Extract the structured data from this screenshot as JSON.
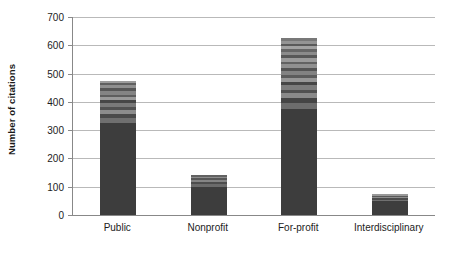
{
  "chart_data": {
    "type": "bar",
    "subtype": "stacked-bar",
    "title": "",
    "xlabel": "",
    "ylabel": "Number of citations",
    "ylim": [
      0,
      700
    ],
    "ytick_step": 100,
    "yticks": [
      0,
      100,
      200,
      300,
      400,
      500,
      600,
      700
    ],
    "ytick_labels": [
      "0",
      "100",
      "200",
      "300",
      "400",
      "500",
      "600",
      "700"
    ],
    "grid": true,
    "grid_axis": "y",
    "legend": "none",
    "categories": [
      "Public",
      "Nonprofit",
      "For-profit",
      "Interdisciplinary"
    ],
    "totals": [
      475,
      140,
      625,
      75
    ],
    "bars": [
      {
        "category": "Public",
        "total": 475,
        "segments": [
          {
            "value": 325,
            "color": "#3d3d3d"
          },
          {
            "value": 18,
            "color": "#6f6f6f"
          },
          {
            "value": 14,
            "color": "#4a4a4a"
          },
          {
            "value": 16,
            "color": "#8c8c8c"
          },
          {
            "value": 10,
            "color": "#525252"
          },
          {
            "value": 14,
            "color": "#7a7a7a"
          },
          {
            "value": 9,
            "color": "#474747"
          },
          {
            "value": 12,
            "color": "#9a9a9a"
          },
          {
            "value": 8,
            "color": "#5e5e5e"
          },
          {
            "value": 13,
            "color": "#848484"
          },
          {
            "value": 9,
            "color": "#565656"
          },
          {
            "value": 11,
            "color": "#8f8f8f"
          },
          {
            "value": 7,
            "color": "#606060"
          },
          {
            "value": 9,
            "color": "#9d9d9d"
          }
        ]
      },
      {
        "category": "Nonprofit",
        "total": 140,
        "segments": [
          {
            "value": 100,
            "color": "#3d3d3d"
          },
          {
            "value": 9,
            "color": "#6b6b6b"
          },
          {
            "value": 7,
            "color": "#4d4d4d"
          },
          {
            "value": 8,
            "color": "#858585"
          },
          {
            "value": 6,
            "color": "#575757"
          },
          {
            "value": 6,
            "color": "#8d8d8d"
          },
          {
            "value": 4,
            "color": "#626262"
          }
        ]
      },
      {
        "category": "For-profit",
        "total": 625,
        "segments": [
          {
            "value": 375,
            "color": "#3d3d3d"
          },
          {
            "value": 22,
            "color": "#6d6d6d"
          },
          {
            "value": 16,
            "color": "#454545"
          },
          {
            "value": 18,
            "color": "#8a8a8a"
          },
          {
            "value": 12,
            "color": "#515151"
          },
          {
            "value": 16,
            "color": "#7c7c7c"
          },
          {
            "value": 11,
            "color": "#464646"
          },
          {
            "value": 14,
            "color": "#979797"
          },
          {
            "value": 10,
            "color": "#5c5c5c"
          },
          {
            "value": 15,
            "color": "#828282"
          },
          {
            "value": 11,
            "color": "#545454"
          },
          {
            "value": 13,
            "color": "#909090"
          },
          {
            "value": 9,
            "color": "#626262"
          },
          {
            "value": 13,
            "color": "#9b9b9b"
          },
          {
            "value": 10,
            "color": "#585858"
          },
          {
            "value": 12,
            "color": "#8b8b8b"
          },
          {
            "value": 9,
            "color": "#666666"
          },
          {
            "value": 11,
            "color": "#a2a2a2"
          },
          {
            "value": 8,
            "color": "#5a5a5a"
          },
          {
            "value": 10,
            "color": "#949494"
          },
          {
            "value": 10,
            "color": "#787878"
          }
        ]
      },
      {
        "category": "Interdisciplinary",
        "total": 75,
        "segments": [
          {
            "value": 48,
            "color": "#3d3d3d"
          },
          {
            "value": 6,
            "color": "#707070"
          },
          {
            "value": 5,
            "color": "#4b4b4b"
          },
          {
            "value": 6,
            "color": "#8d8d8d"
          },
          {
            "value": 4,
            "color": "#5a5a5a"
          },
          {
            "value": 6,
            "color": "#999999"
          }
        ]
      }
    ],
    "colors": {
      "base_segment": "#3d3d3d",
      "gridline": "#b9b9b9",
      "axis": "#888888",
      "text": "#1c1c1c",
      "background": "#ffffff"
    }
  }
}
